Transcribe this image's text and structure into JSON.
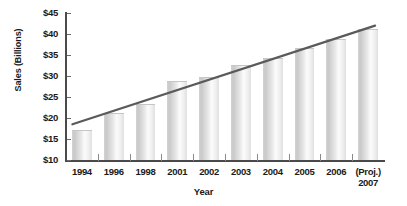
{
  "chart_data": {
    "type": "bar",
    "title": "",
    "xlabel": "Year",
    "ylabel": "Sales (Billions)",
    "categories": [
      "1994",
      "1996",
      "1998",
      "2001",
      "2002",
      "2003",
      "2004",
      "2005",
      "2006",
      "(Proj.) 2007"
    ],
    "category_lines": [
      [
        "1994"
      ],
      [
        "1996"
      ],
      [
        "1998"
      ],
      [
        "2001"
      ],
      [
        "2002"
      ],
      [
        "2003"
      ],
      [
        "2004"
      ],
      [
        "2005"
      ],
      [
        "2006"
      ],
      [
        "(Proj.)",
        "2007"
      ]
    ],
    "values": [
      17,
      21,
      23,
      28.5,
      29.5,
      32.5,
      34,
      36.5,
      38.5,
      41
    ],
    "ylim": [
      10,
      45
    ],
    "ytick_values": [
      45,
      40,
      35,
      30,
      25,
      20,
      15,
      10
    ],
    "ytick_labels": [
      "$45",
      "$40",
      "$35",
      "$30",
      "$25",
      "$20",
      "$15",
      "$10"
    ],
    "grid": false,
    "legend": "none",
    "bar_color": "#e4e4e4",
    "axis_color": "#4a4a4a",
    "trendline": {
      "label": "",
      "color": "#5a5a5a",
      "x_start_category_index": 0,
      "x_end_category_index": 9,
      "y_start": 18.5,
      "y_end": 42
    }
  }
}
